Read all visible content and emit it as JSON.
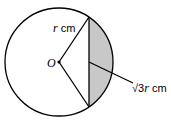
{
  "diagram": {
    "center_label": "O",
    "radius_label": "r cm",
    "radius_var": "r",
    "radius_unit": " cm",
    "chord_label": "√3r cm",
    "chord_sqrt": "√3",
    "chord_var": "r",
    "chord_unit": " cm",
    "shade_color": "#c8c8c8",
    "stroke_color": "#000000"
  }
}
